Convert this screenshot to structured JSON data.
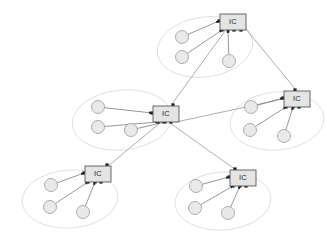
{
  "diagram": {
    "width": 327,
    "height": 243,
    "background_color": "#ffffff",
    "colors": {
      "ellipse_stroke": "#d8d8d8",
      "node_fill": "#e9e9e9",
      "node_stroke": "#9a9a9a",
      "ic_fill": "#e4e4e4",
      "ic_stroke": "#5a5a5a",
      "intra_link": "#6b6b6b",
      "inter_link": "#8d8d8d",
      "port": "#1c1c1c",
      "label_text": "#2a2a2a"
    }
  },
  "clusters": [
    {
      "id": "cluster-top",
      "name": "top-cluster",
      "ellipse": {
        "cx": 205,
        "cy": 47,
        "rx": 48,
        "ry": 30,
        "rotate": -8
      },
      "ic": {
        "label": "IC",
        "x": 220,
        "y": 14,
        "w": 26,
        "h": 16,
        "ports": [
          {
            "x": 219,
            "y": 21
          },
          {
            "x": 222,
            "y": 30
          },
          {
            "x": 228,
            "y": 30
          },
          {
            "x": 234,
            "y": 30
          },
          {
            "x": 241,
            "y": 30
          }
        ]
      },
      "nodes": [
        {
          "cx": 182,
          "cy": 37,
          "r": 6.5
        },
        {
          "cx": 182,
          "cy": 57,
          "r": 6.5
        },
        {
          "cx": 229,
          "cy": 61,
          "r": 6.5
        }
      ]
    },
    {
      "id": "cluster-left",
      "name": "left-cluster",
      "ellipse": {
        "cx": 122,
        "cy": 120,
        "rx": 50,
        "ry": 30,
        "rotate": -6
      },
      "ic": {
        "label": "IC",
        "x": 153,
        "y": 106,
        "w": 26,
        "h": 16,
        "ports": [
          {
            "x": 152,
            "y": 113
          },
          {
            "x": 158,
            "y": 122
          },
          {
            "x": 165,
            "y": 122
          },
          {
            "x": 171,
            "y": 122
          },
          {
            "x": 173,
            "y": 105
          }
        ]
      },
      "nodes": [
        {
          "cx": 98,
          "cy": 107,
          "r": 6.5
        },
        {
          "cx": 98,
          "cy": 127,
          "r": 6.5
        },
        {
          "cx": 131,
          "cy": 130,
          "r": 6.5
        }
      ]
    },
    {
      "id": "cluster-right",
      "name": "right-cluster",
      "ellipse": {
        "cx": 277,
        "cy": 121,
        "rx": 47,
        "ry": 29,
        "rotate": -5
      },
      "ic": {
        "label": "IC",
        "x": 284,
        "y": 91,
        "w": 26,
        "h": 16,
        "ports": [
          {
            "x": 283,
            "y": 98
          },
          {
            "x": 286,
            "y": 107
          },
          {
            "x": 293,
            "y": 107
          },
          {
            "x": 299,
            "y": 107
          },
          {
            "x": 295,
            "y": 90
          }
        ]
      },
      "nodes": [
        {
          "cx": 251,
          "cy": 107,
          "r": 6.5
        },
        {
          "cx": 250,
          "cy": 130,
          "r": 6.5
        },
        {
          "cx": 284,
          "cy": 136,
          "r": 6.5
        }
      ]
    },
    {
      "id": "cluster-bottom-left",
      "name": "bottom-left-cluster",
      "ellipse": {
        "cx": 70,
        "cy": 199,
        "rx": 48,
        "ry": 29,
        "rotate": -4
      },
      "ic": {
        "label": "IC",
        "x": 85,
        "y": 166,
        "w": 26,
        "h": 16,
        "ports": [
          {
            "x": 84,
            "y": 173
          },
          {
            "x": 88,
            "y": 182
          },
          {
            "x": 95,
            "y": 182
          },
          {
            "x": 101,
            "y": 182
          },
          {
            "x": 107,
            "y": 165
          }
        ]
      },
      "nodes": [
        {
          "cx": 51,
          "cy": 185,
          "r": 6.5
        },
        {
          "cx": 50,
          "cy": 207,
          "r": 6.5
        },
        {
          "cx": 83,
          "cy": 212,
          "r": 6.5
        }
      ]
    },
    {
      "id": "cluster-bottom-right",
      "name": "bottom-right-cluster",
      "ellipse": {
        "cx": 223,
        "cy": 201,
        "rx": 48,
        "ry": 29,
        "rotate": -4
      },
      "ic": {
        "label": "IC",
        "x": 230,
        "y": 170,
        "w": 26,
        "h": 16,
        "ports": [
          {
            "x": 229,
            "y": 177
          },
          {
            "x": 233,
            "y": 186
          },
          {
            "x": 240,
            "y": 186
          },
          {
            "x": 246,
            "y": 186
          },
          {
            "x": 235,
            "y": 169
          }
        ]
      },
      "nodes": [
        {
          "cx": 196,
          "cy": 186,
          "r": 6.5
        },
        {
          "cx": 195,
          "cy": 208,
          "r": 6.5
        },
        {
          "cx": 228,
          "cy": 213,
          "r": 6.5
        }
      ]
    }
  ],
  "inter_cluster_links": [
    {
      "name": "link-center-to-top",
      "from": "cluster-left",
      "to": "cluster-top",
      "x1": 172,
      "y1": 104,
      "x2": 225,
      "y2": 31
    },
    {
      "name": "link-top-to-right",
      "from": "cluster-top",
      "to": "cluster-right",
      "x1": 246,
      "y1": 29,
      "x2": 296,
      "y2": 90
    },
    {
      "name": "link-center-to-right",
      "from": "cluster-left",
      "to": "cluster-right",
      "x1": 176,
      "y1": 122,
      "x2": 283,
      "y2": 99
    },
    {
      "name": "link-center-to-bottom-left",
      "from": "cluster-left",
      "to": "cluster-bottom-left",
      "x1": 160,
      "y1": 123,
      "x2": 108,
      "y2": 166
    },
    {
      "name": "link-center-to-bottom-right",
      "from": "cluster-left",
      "to": "cluster-bottom-right",
      "x1": 170,
      "y1": 123,
      "x2": 236,
      "y2": 170
    }
  ],
  "intra_cluster_links": {
    "description": "Each node circle connects to its cluster IC box port"
  }
}
